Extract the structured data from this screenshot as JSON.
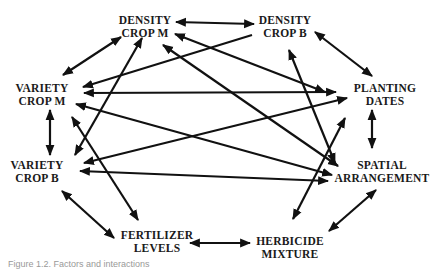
{
  "diagram": {
    "nodes": [
      {
        "id": "density_m",
        "line1": "DENSITY",
        "line2": "CROP M",
        "x": 145,
        "y": 27
      },
      {
        "id": "density_b",
        "line1": "DENSITY",
        "line2": "CROP B",
        "x": 285,
        "y": 27
      },
      {
        "id": "variety_m",
        "line1": "VARIETY",
        "line2": "CROP M",
        "x": 42,
        "y": 95
      },
      {
        "id": "planting",
        "line1": "PLANTING",
        "line2": "DATES",
        "x": 385,
        "y": 95
      },
      {
        "id": "variety_b",
        "line1": "VARIETY",
        "line2": "CROP B",
        "x": 37,
        "y": 172
      },
      {
        "id": "spatial",
        "line1": "SPATIAL",
        "line2": "ARRANGEMENT",
        "x": 382,
        "y": 172
      },
      {
        "id": "fertilizer",
        "line1": "FERTILIZER",
        "line2": "LEVELS",
        "x": 157,
        "y": 242
      },
      {
        "id": "herbicide",
        "line1": "HERBICIDE",
        "line2": "MIXTURE",
        "x": 290,
        "y": 248
      }
    ],
    "edges": [
      {
        "from": "density_m",
        "to": "density_b",
        "x1": 176,
        "y1": 22,
        "x2": 254,
        "y2": 24,
        "both": true
      },
      {
        "from": "density_m",
        "to": "variety_m",
        "x1": 121,
        "y1": 37,
        "x2": 63,
        "y2": 75,
        "both": true
      },
      {
        "from": "density_b",
        "to": "variety_m",
        "x1": 252,
        "y1": 35,
        "x2": 83,
        "y2": 87,
        "both": false
      },
      {
        "from": "density_b",
        "to": "planting",
        "x1": 315,
        "y1": 32,
        "x2": 372,
        "y2": 76,
        "both": true
      },
      {
        "from": "density_m",
        "to": "planting",
        "x1": 175,
        "y1": 34,
        "x2": 325,
        "y2": 92,
        "both": true
      },
      {
        "from": "density_m",
        "to": "spatial",
        "x1": 163,
        "y1": 45,
        "x2": 338,
        "y2": 166,
        "both": true
      },
      {
        "from": "density_m",
        "to": "variety_b",
        "x1": 142,
        "y1": 38,
        "x2": 75,
        "y2": 155,
        "both": true
      },
      {
        "from": "variety_m",
        "to": "planting",
        "x1": 84,
        "y1": 93,
        "x2": 336,
        "y2": 92,
        "both": true
      },
      {
        "from": "variety_m",
        "to": "variety_b",
        "x1": 50,
        "y1": 110,
        "x2": 50,
        "y2": 155,
        "both": true
      },
      {
        "from": "variety_m",
        "to": "spatial",
        "x1": 76,
        "y1": 104,
        "x2": 332,
        "y2": 175,
        "both": true
      },
      {
        "from": "variety_m",
        "to": "fertilizer",
        "x1": 72,
        "y1": 117,
        "x2": 138,
        "y2": 220,
        "both": true
      },
      {
        "from": "variety_b",
        "to": "planting",
        "x1": 84,
        "y1": 163,
        "x2": 347,
        "y2": 98,
        "both": true
      },
      {
        "from": "variety_b",
        "to": "spatial",
        "x1": 80,
        "y1": 171,
        "x2": 328,
        "y2": 181,
        "both": true
      },
      {
        "from": "variety_b",
        "to": "fertilizer",
        "x1": 62,
        "y1": 191,
        "x2": 114,
        "y2": 238,
        "both": true
      },
      {
        "from": "density_b",
        "to": "spatial",
        "x1": 289,
        "y1": 50,
        "x2": 335,
        "y2": 163,
        "both": true
      },
      {
        "from": "planting",
        "to": "spatial",
        "x1": 372,
        "y1": 110,
        "x2": 372,
        "y2": 148,
        "both": true
      },
      {
        "from": "spatial",
        "to": "herbicide",
        "x1": 376,
        "y1": 190,
        "x2": 329,
        "y2": 231,
        "both": true
      },
      {
        "from": "planting",
        "to": "herbicide",
        "x1": 345,
        "y1": 118,
        "x2": 293,
        "y2": 219,
        "both": true
      },
      {
        "from": "fertilizer",
        "to": "herbicide",
        "x1": 190,
        "y1": 243,
        "x2": 250,
        "y2": 243,
        "both": true
      }
    ],
    "stroke_color": "#111111"
  },
  "caption": "Figure 1.2. Factors and interactions"
}
